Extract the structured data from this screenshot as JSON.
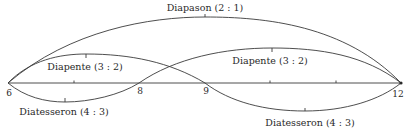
{
  "diagram": {
    "type": "harmonic-ratio-arcs",
    "baseline": {
      "points": [
        {
          "value": "6",
          "position": 6,
          "labeled": true
        },
        {
          "value": "7",
          "position": 7,
          "labeled": false
        },
        {
          "value": "8",
          "position": 8,
          "labeled": true
        },
        {
          "value": "9",
          "position": 9,
          "labeled": true
        },
        {
          "value": "10",
          "position": 10,
          "labeled": false
        },
        {
          "value": "11",
          "position": 11,
          "labeled": false
        },
        {
          "value": "12",
          "position": 12,
          "labeled": true
        }
      ]
    },
    "labels": {
      "n6": "6",
      "n8": "8",
      "n9": "9",
      "n12": "12"
    },
    "arcs": [
      {
        "name": "Diapason",
        "ratio": "2 : 1",
        "text": "Diapason (2 : 1)",
        "from": 6,
        "to": 12,
        "side": "above"
      },
      {
        "name": "Diapente",
        "ratio": "3 : 2",
        "text": "Diapente (3 : 2)",
        "from": 6,
        "to": 9,
        "side": "above"
      },
      {
        "name": "Diapente",
        "ratio": "3 : 2",
        "text": "Diapente (3 : 2)",
        "from": 8,
        "to": 12,
        "side": "above"
      },
      {
        "name": "Diatesseron",
        "ratio": "4 : 3",
        "text": "Diatesseron (4 : 3)",
        "from": 6,
        "to": 8,
        "side": "below"
      },
      {
        "name": "Diatesseron",
        "ratio": "4 : 3",
        "text": "Diatesseron (4 : 3)",
        "from": 9,
        "to": 12,
        "side": "below"
      }
    ],
    "colors": {
      "line": "#3a3a3a",
      "text": "#2a2a2a",
      "background": "#ffffff"
    }
  }
}
